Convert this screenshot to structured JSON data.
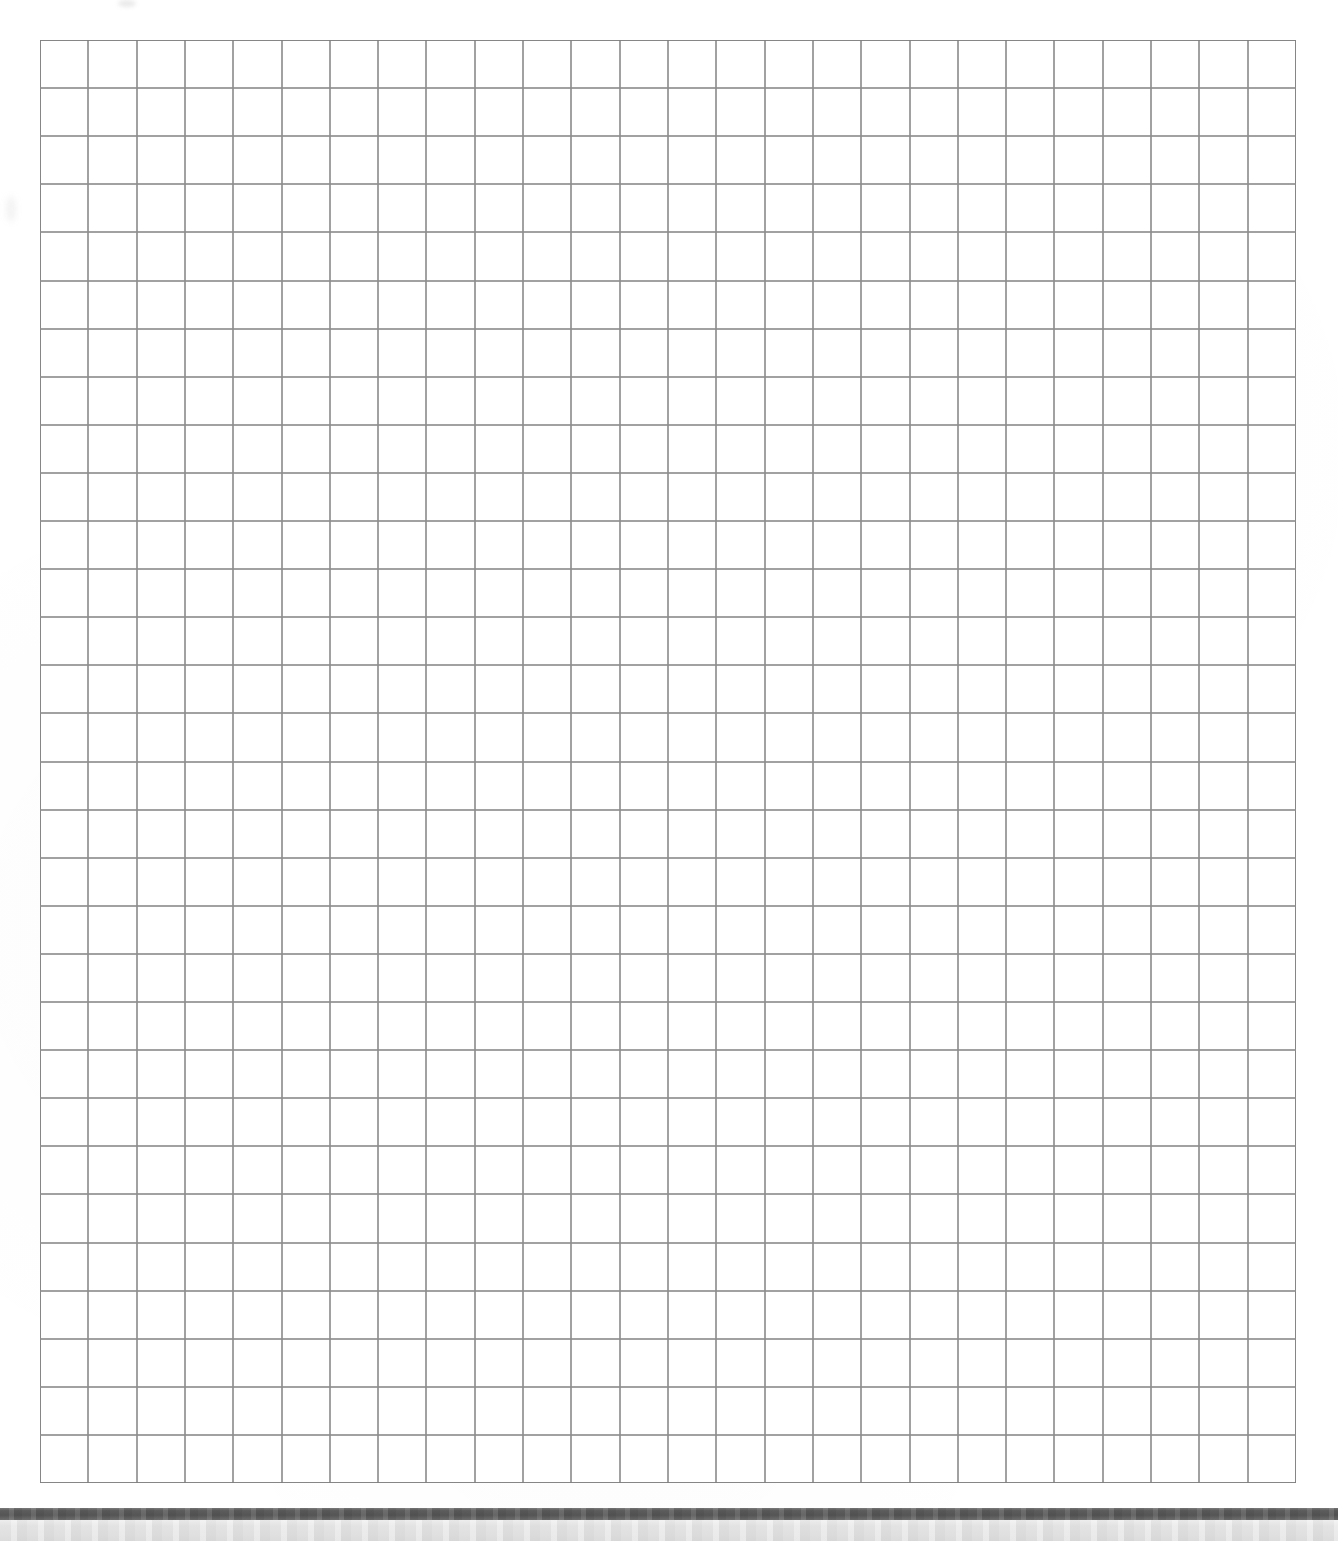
{
  "document": {
    "kind": "scanned-page",
    "title": "Blank graph paper sheet",
    "page_width": 1338,
    "page_height": 1541,
    "background_color": "#ffffff",
    "content_text": ""
  },
  "grid": {
    "name": "graph-paper-grid",
    "columns": 26,
    "rows": 30,
    "cell_width": 48.3,
    "cell_height": 48.1,
    "left": 40,
    "top": 40,
    "width": 1256,
    "height": 1443,
    "line_color": "#8c8c8c",
    "line_width": 2,
    "border_color": "#7f7f7f",
    "border_width": 2,
    "fill_color": "#ffffff",
    "label": ""
  },
  "scan_artifacts": {
    "dark_band": {
      "label": "",
      "color": "#585858",
      "top": 1508,
      "height": 12
    },
    "light_band": {
      "label": "",
      "color": "#e1e1e1",
      "top": 1520,
      "height": 21
    },
    "smudges": [
      {
        "name": "top-margin-smudge",
        "label": ""
      },
      {
        "name": "left-margin-smudge",
        "label": ""
      }
    ]
  }
}
